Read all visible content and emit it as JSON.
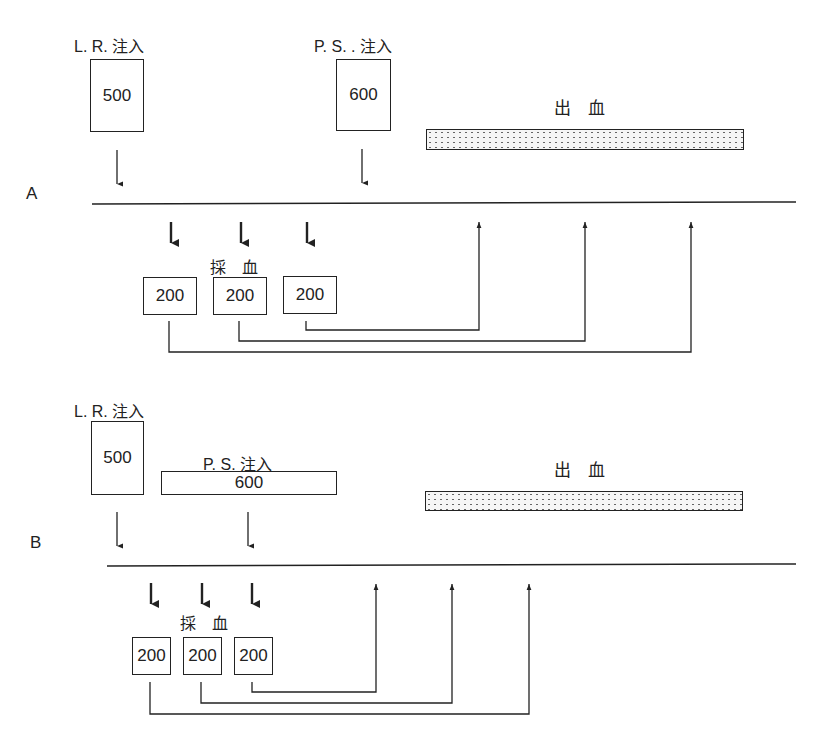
{
  "panels": [
    {
      "id": "A",
      "letter": "A",
      "lr_injection": {
        "label": "L. R. 注入",
        "volume": "500"
      },
      "ps_injection": {
        "label": "P. S. . 注入",
        "volume": "600",
        "shape": "tall-box"
      },
      "hemorrhage": {
        "label": "出　血"
      },
      "blood_collection": {
        "label": "採　血",
        "volumes": [
          "200",
          "200",
          "200"
        ]
      }
    },
    {
      "id": "B",
      "letter": "B",
      "lr_injection": {
        "label": "L. R. 注入",
        "volume": "500"
      },
      "ps_injection": {
        "label": "P. S. 注入",
        "volume": "600",
        "shape": "wide-bar"
      },
      "hemorrhage": {
        "label": "出　血"
      },
      "blood_collection": {
        "label": "採　血",
        "volumes": [
          "200",
          "200",
          "200"
        ]
      }
    }
  ],
  "colors": {
    "ink": "#222222",
    "dot_fill": "#f6f6f6"
  }
}
